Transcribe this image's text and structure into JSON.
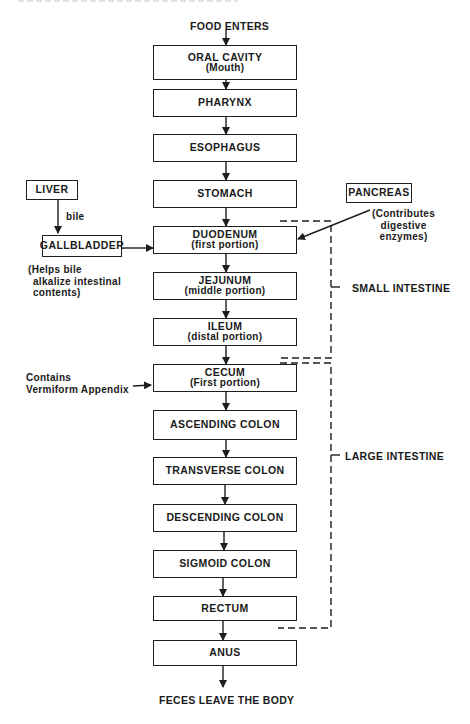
{
  "flow": {
    "start": "FOOD ENTERS",
    "end": "FECES LEAVE THE BODY",
    "organs": [
      {
        "title": "ORAL CAVITY",
        "sub": "(Mouth)"
      },
      {
        "title": "PHARYNX",
        "sub": ""
      },
      {
        "title": "ESOPHAGUS",
        "sub": ""
      },
      {
        "title": "STOMACH",
        "sub": ""
      },
      {
        "title": "DUODENUM",
        "sub": "(first portion)"
      },
      {
        "title": "JEJUNUM",
        "sub": "(middle portion)"
      },
      {
        "title": "ILEUM",
        "sub": "(distal portion)"
      },
      {
        "title": "CECUM",
        "sub": "(First portion)"
      },
      {
        "title": "ASCENDING COLON",
        "sub": ""
      },
      {
        "title": "TRANSVERSE COLON",
        "sub": ""
      },
      {
        "title": "DESCENDING COLON",
        "sub": ""
      },
      {
        "title": "SIGMOID COLON",
        "sub": ""
      },
      {
        "title": "RECTUM",
        "sub": ""
      },
      {
        "title": "ANUS",
        "sub": ""
      }
    ]
  },
  "accessory": {
    "liver": "LIVER",
    "bile": "bile",
    "gallbladder": "GALLBLADDER",
    "gallbladder_note": [
      "(Helps bile",
      "alkalize intestinal",
      "contents)"
    ],
    "pancreas": "PANCREAS",
    "pancreas_note": [
      "(Contributes",
      "digestive",
      "enzymes)"
    ]
  },
  "annotations": {
    "appendix_note": [
      "Contains",
      "Vermiform Appendix"
    ],
    "small_intestine": "SMALL INTESTINE",
    "large_intestine": "LARGE INTESTINE"
  },
  "colors": {
    "ink": "#1e1e1e",
    "background": "#ffffff"
  }
}
